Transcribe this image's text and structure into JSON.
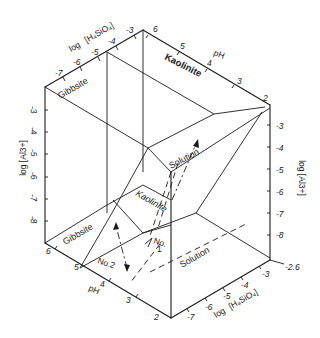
{
  "figure": {
    "title": "",
    "type": "3D stability diagram (cube) — Gibbsite / Kaolinite / Solution",
    "axes": {
      "h4sio4_top": {
        "label_prefix": "log",
        "label_species": "[H₄SiO₄]",
        "ticks": [
          "-7",
          "-6",
          "-5",
          "-4",
          "-3"
        ]
      },
      "ph_top": {
        "label": "pH",
        "ticks": [
          "6",
          "5",
          "4",
          "3",
          "2"
        ]
      },
      "al_left": {
        "label": "log [Al3+]",
        "ticks": [
          "-3",
          "-4",
          "-5",
          "-6",
          "-7",
          "-8"
        ]
      },
      "al_right": {
        "label": "log [Al3+]",
        "ticks": [
          "-3",
          "-4",
          "-5",
          "-6",
          "-7",
          "-8"
        ]
      },
      "ph_bottom": {
        "label": "pH",
        "ticks": [
          "6",
          "5",
          "4",
          "3",
          "2"
        ]
      },
      "h4sio4_bottom": {
        "label_prefix": "log",
        "label_species": "[H₄SiO₄]",
        "ticks": [
          "-7",
          "-6",
          "-5",
          "-4",
          "-3"
        ]
      },
      "corner_value": "-2.6"
    },
    "regions": {
      "gibbsite_top": "Gibbsite",
      "kaolinite_top": "Kaolinite",
      "solution_mid": "Solution",
      "kaolinite_mid": "Kaolinite",
      "gibbsite_bottom": "Gibbsite",
      "solution_bottom": "Solution"
    },
    "paths": {
      "no2": "No.2",
      "no1_line1": "No.",
      "no1_line2": "1"
    }
  }
}
